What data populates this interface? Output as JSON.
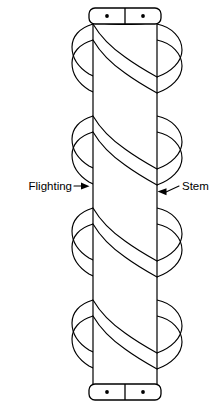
{
  "figure": {
    "background_color": "#ffffff",
    "line_color": "#000000",
    "width": 215,
    "height": 408
  },
  "labels": {
    "flighting": {
      "text": "Flighting",
      "text_x": 72,
      "text_y": 190,
      "anchor": "end",
      "leader_path": "M 74 186 L 81 186",
      "arrow_points": "81,182.6 89.5,186.2 81,189.6"
    },
    "stem": {
      "text": "Stem",
      "text_x": 182,
      "text_y": 190,
      "anchor": "start",
      "leader_path": "M 179 186 L 166 192",
      "arrow_points": "166.5,188.2 157.5,191.5 166.5,195.2"
    }
  },
  "stem": {
    "left_x": 93,
    "right_x": 157,
    "top_y": 20,
    "bottom_y": 388,
    "cap_arc_sag": 7
  },
  "top_cap": {
    "left_x": 89,
    "right_x": 161,
    "top_y": 8,
    "bottom_y": 24,
    "corner_radius": 6,
    "divider_x": 125,
    "dot_left_x": 107,
    "dot_right_x": 143,
    "dot_y": 16,
    "dot_radius": 1.9
  },
  "bottom_cap": {
    "left_x": 89,
    "right_x": 161,
    "top_y": 384,
    "bottom_y": 400,
    "corner_radius": 6,
    "divider_x": 125,
    "dot_left_x": 107,
    "dot_right_x": 143,
    "dot_y": 392,
    "dot_radius": 1.9
  },
  "flighting": {
    "turns": 4,
    "pitch": 92,
    "left_extent_x": 72,
    "right_extent_x": 182,
    "center_x": 125,
    "start_y": 24,
    "ribbon_width": 16,
    "lobe_height": 26
  }
}
